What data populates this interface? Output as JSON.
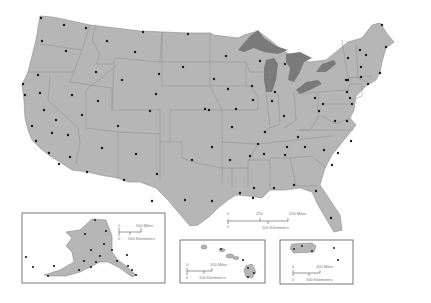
{
  "map": {
    "title": "United States state capitals",
    "colors": {
      "land": "#b6b6b6",
      "lakes": "#7a7a7a",
      "borders": "#8c8c8c",
      "capital_dot": "#1a1a1a",
      "background": "#ffffff"
    },
    "main_scale": {
      "zero_miles": "0",
      "mid_miles": "250",
      "end_miles": "500 Miles",
      "zero_km": "0",
      "end_km": "500 Kilometers"
    },
    "alaska_inset": {
      "name": "Alaska",
      "zero_miles": "0",
      "end_miles": "500 Miles",
      "zero_km": "0",
      "end_km": "500 Kilometers"
    },
    "hawaii_inset": {
      "name": "Hawaii",
      "zero_miles": "0",
      "end_miles": "100 Miles",
      "zero_km": "0",
      "end_km": "100 Kilometers"
    },
    "puerto_rico_inset": {
      "name": "Puerto Rico",
      "zero_miles": "0",
      "end_miles": "100 Miles",
      "zero_km": "0",
      "end_km": "100 Kilometers"
    }
  }
}
